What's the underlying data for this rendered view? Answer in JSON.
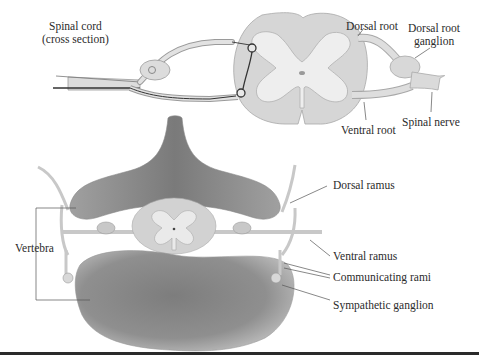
{
  "figure": {
    "upper_panel": {
      "labels": {
        "spinal_cord_line1": "Spinal cord",
        "spinal_cord_line2": "(cross section)",
        "dorsal_root": "Dorsal root",
        "dorsal_root_ganglion_line1": "Dorsal root",
        "dorsal_root_ganglion_line2": "ganglion",
        "ventral_root": "Ventral root",
        "spinal_nerve": "Spinal nerve"
      }
    },
    "lower_panel": {
      "labels": {
        "dorsal_ramus": "Dorsal ramus",
        "vertebra": "Vertebra",
        "ventral_ramus": "Ventral ramus",
        "communicating_rami": "Communicating rami",
        "sympathetic_ganglion": "Sympathetic ganglion"
      }
    },
    "colors": {
      "white_matter": "#d6d6d6",
      "gray_matter": "#ececec",
      "bone": "#9a9a9a",
      "nerve": "#dcdcdc",
      "outline": "#8a8a8a",
      "text": "#2b2b2b",
      "rule": "#2a2a2a"
    }
  }
}
